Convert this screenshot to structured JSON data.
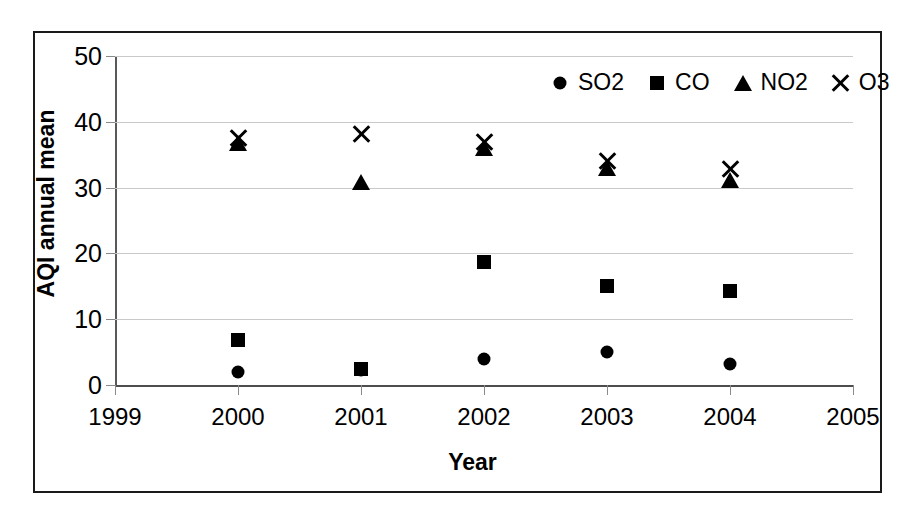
{
  "chart_data": {
    "type": "scatter",
    "title": "",
    "xlabel": "Year",
    "ylabel": "AQI annual mean",
    "xlim": [
      1999,
      2005
    ],
    "ylim": [
      0,
      50
    ],
    "xticks": [
      1999,
      2000,
      2001,
      2002,
      2003,
      2004,
      2005
    ],
    "yticks": [
      0,
      10,
      20,
      30,
      40,
      50
    ],
    "grid": "horizontal",
    "legend_position": "top-right",
    "x": [
      2000,
      2001,
      2002,
      2003,
      2004
    ],
    "series": [
      {
        "name": "SO2",
        "marker": "circle",
        "color": "#000000",
        "values": [
          1.9,
          2.3,
          4.0,
          5.0,
          3.2
        ]
      },
      {
        "name": "CO",
        "marker": "square",
        "color": "#000000",
        "values": [
          6.8,
          2.5,
          18.7,
          15.0,
          14.3
        ]
      },
      {
        "name": "NO2",
        "marker": "triangle",
        "color": "#000000",
        "values": [
          37.4,
          31.4,
          36.6,
          33.6,
          31.8
        ]
      },
      {
        "name": "O3",
        "marker": "ex",
        "color": "#000000",
        "values": [
          37.5,
          38.2,
          37.0,
          34.0,
          32.8
        ]
      }
    ]
  },
  "axis": {
    "y_title": "AQI annual mean",
    "x_title": "Year",
    "y_tick_labels": [
      "0",
      "10",
      "20",
      "30",
      "40",
      "50"
    ],
    "x_tick_labels": [
      "1999",
      "2000",
      "2001",
      "2002",
      "2003",
      "2004",
      "2005"
    ]
  },
  "legend": {
    "entries": [
      {
        "label": "SO2",
        "marker": "circle-marker-icon"
      },
      {
        "label": "CO",
        "marker": "square-marker-icon"
      },
      {
        "label": "NO2",
        "marker": "triangle-marker-icon"
      },
      {
        "label": "O3",
        "marker": "x-marker-icon"
      }
    ]
  },
  "colors": {
    "marker": "#000000",
    "gridline": "#c9c9c9",
    "axis": "#595959",
    "frame": "#1a1a1a",
    "background": "#ffffff"
  }
}
